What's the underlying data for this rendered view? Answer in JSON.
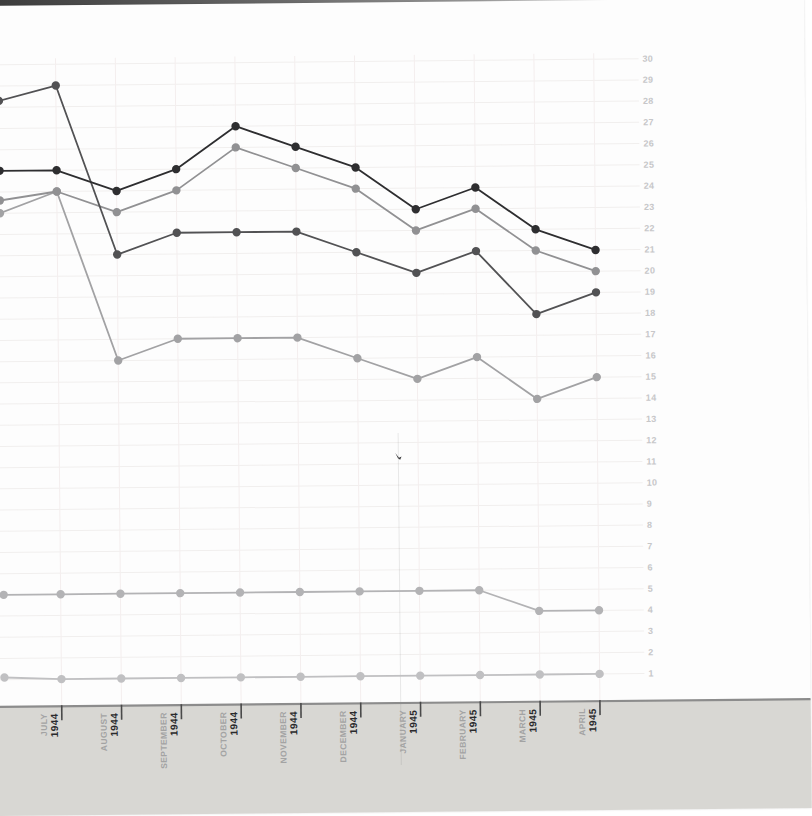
{
  "page": {
    "background_color": "#ffffff",
    "paper_color": "#fdfdfd",
    "photo_edge_color": "#3d3d3d",
    "axis_strip_color": "#d8d7d3",
    "gridline_color": "#f1efee",
    "y_label_color": "#c7c7c9",
    "month_label_color": "#a3a3a3",
    "year_label_color": "#2a2a2c"
  },
  "chart_data": {
    "type": "line",
    "title": "",
    "xlabel": "",
    "ylabel": "",
    "grid": true,
    "legend": false,
    "y_axis_side": "right",
    "ylim": [
      0,
      30
    ],
    "y_tick_step": 1,
    "y_tick_labels": [
      30,
      29,
      28,
      27,
      26,
      25,
      24,
      23,
      22,
      21,
      20,
      19,
      18,
      17,
      16,
      15,
      14,
      13,
      12,
      11,
      10,
      9,
      8,
      7,
      6,
      5,
      4,
      3,
      2,
      1
    ],
    "x_labels": [
      {
        "month": "JULY",
        "year": "1944"
      },
      {
        "month": "AUGUST",
        "year": "1944"
      },
      {
        "month": "SEPTEMBER",
        "year": "1944"
      },
      {
        "month": "OCTOBER",
        "year": "1944"
      },
      {
        "month": "NOVEMBER",
        "year": "1944"
      },
      {
        "month": "DECEMBER",
        "year": "1944"
      },
      {
        "month": "JANUARY",
        "year": "1945"
      },
      {
        "month": "FEBRUARY",
        "year": "1945"
      },
      {
        "month": "MARCH",
        "year": "1945"
      },
      {
        "month": "APRIL",
        "year": "1945"
      }
    ],
    "series": [
      {
        "name": "line-1-black",
        "color": "#2e2e30",
        "edge_value": 25.0,
        "values": [
          25,
          24,
          25,
          27,
          26,
          25,
          23,
          24,
          22,
          21
        ]
      },
      {
        "name": "line-2-dark-gray",
        "color": "#525254",
        "edge_value": 28.3,
        "values": [
          29,
          21,
          22,
          22,
          22,
          21,
          20,
          21,
          18,
          19
        ]
      },
      {
        "name": "line-3-gray",
        "color": "#919193",
        "edge_value": 23.6,
        "values": [
          24,
          23,
          24,
          26,
          25,
          24,
          22,
          23,
          21,
          20
        ]
      },
      {
        "name": "line-4-light-gray",
        "color": "#a2a2a4",
        "edge_value": 23.0,
        "values": [
          24,
          16,
          17,
          17,
          17,
          16,
          15,
          16,
          14,
          15
        ]
      },
      {
        "name": "line-5-pale-gray",
        "color": "#b3b3b5",
        "edge_value": 5.0,
        "values": [
          5,
          5,
          5,
          5,
          5,
          5,
          5,
          5,
          4,
          4
        ]
      },
      {
        "name": "line-6-palest-gray",
        "color": "#c0c0c2",
        "edge_value": 1.1,
        "values": [
          1,
          1,
          1,
          1,
          1,
          1,
          1,
          1,
          1,
          1
        ]
      }
    ]
  }
}
